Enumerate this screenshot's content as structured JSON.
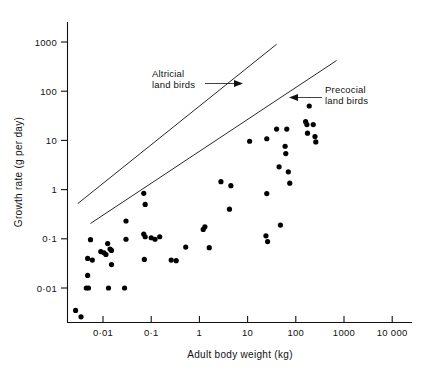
{
  "chart_data": {
    "type": "scatter",
    "title": "",
    "xlabel": "Adult body weight (kg)",
    "ylabel": "Growth rate (g per day)",
    "xscale": "log",
    "yscale": "log",
    "xlim": [
      0.0015,
      30000
    ],
    "ylim": [
      0.0012,
      3000
    ],
    "grid": false,
    "legend": "none",
    "xticks": [
      {
        "value": 0.01,
        "label": "0·01"
      },
      {
        "value": 0.1,
        "label": "0·1"
      },
      {
        "value": 1,
        "label": "1"
      },
      {
        "value": 10,
        "label": "10"
      },
      {
        "value": 100,
        "label": "100"
      },
      {
        "value": 1000,
        "label": "1000"
      },
      {
        "value": 10000,
        "label": "10 000"
      }
    ],
    "yticks": [
      {
        "value": 0.01,
        "label": "0·01"
      },
      {
        "value": 0.1,
        "label": "0·1"
      },
      {
        "value": 1,
        "label": "1"
      },
      {
        "value": 10,
        "label": "10"
      },
      {
        "value": 100,
        "label": "100"
      },
      {
        "value": 1000,
        "label": "1000"
      }
    ],
    "series": [
      {
        "name": "birds",
        "marker": "filled-circle",
        "color": "#000000",
        "points": [
          [
            0.0027,
            0.0035
          ],
          [
            0.0035,
            0.0026
          ],
          [
            0.0045,
            0.01
          ],
          [
            0.005,
            0.01
          ],
          [
            0.0048,
            0.018
          ],
          [
            0.0048,
            0.04
          ],
          [
            0.006,
            0.037
          ],
          [
            0.0055,
            0.096
          ],
          [
            0.009,
            0.055
          ],
          [
            0.0105,
            0.052
          ],
          [
            0.0115,
            0.048
          ],
          [
            0.0125,
            0.08
          ],
          [
            0.014,
            0.062
          ],
          [
            0.015,
            0.058
          ],
          [
            0.015,
            0.03
          ],
          [
            0.013,
            0.01
          ],
          [
            0.028,
            0.01
          ],
          [
            0.03,
            0.098
          ],
          [
            0.03,
            0.23
          ],
          [
            0.07,
            0.84
          ],
          [
            0.075,
            0.5
          ],
          [
            0.07,
            0.125
          ],
          [
            0.075,
            0.11
          ],
          [
            0.072,
            0.038
          ],
          [
            0.1,
            0.105
          ],
          [
            0.12,
            0.098
          ],
          [
            0.15,
            0.11
          ],
          [
            0.26,
            0.037
          ],
          [
            0.33,
            0.036
          ],
          [
            0.52,
            0.068
          ],
          [
            1.2,
            0.155
          ],
          [
            1.3,
            0.175
          ],
          [
            1.6,
            0.066
          ],
          [
            2.8,
            1.45
          ],
          [
            4.5,
            1.2
          ],
          [
            4.2,
            0.4
          ],
          [
            11.0,
            9.6
          ],
          [
            25.0,
            10.8
          ],
          [
            25.0,
            0.83
          ],
          [
            24.0,
            0.115
          ],
          [
            26.0,
            0.088
          ],
          [
            40.0,
            17.0
          ],
          [
            45.0,
            2.9
          ],
          [
            48.0,
            0.19
          ],
          [
            60.0,
            7.6
          ],
          [
            62.0,
            5.4
          ],
          [
            65.0,
            17.0
          ],
          [
            70.0,
            2.3
          ],
          [
            75.0,
            1.35
          ],
          [
            160.0,
            24.0
          ],
          [
            170.0,
            21.0
          ],
          [
            175.0,
            14.0
          ],
          [
            190.0,
            50.0
          ],
          [
            230.0,
            21.0
          ],
          [
            250.0,
            12.0
          ],
          [
            260.0,
            9.3
          ]
        ]
      }
    ],
    "trend_lines": [
      {
        "name": "altricial-land-birds",
        "label": "Altricial\nland birds",
        "label_line1": "Altricial",
        "label_line2": "land birds",
        "p1": [
          0.003,
          0.52
        ],
        "p2": [
          40.0,
          900.0
        ]
      },
      {
        "name": "precocial-land-birds",
        "label": "Precocial\nland birds",
        "label_line1": "Precocial",
        "label_line2": "land birds",
        "p1": [
          0.0055,
          0.205
        ],
        "p2": [
          700.0,
          420.0
        ]
      }
    ],
    "annotations": [
      {
        "name": "altricial-annotation",
        "line1": "Altricial",
        "line2": "land birds",
        "arrow_direction": "right"
      },
      {
        "name": "precocial-annotation",
        "line1": "Precocial",
        "line2": "land birds",
        "arrow_direction": "left"
      }
    ]
  },
  "axes": {
    "x_title": "Adult body weight (kg)",
    "y_title": "Growth rate (g per day)"
  }
}
